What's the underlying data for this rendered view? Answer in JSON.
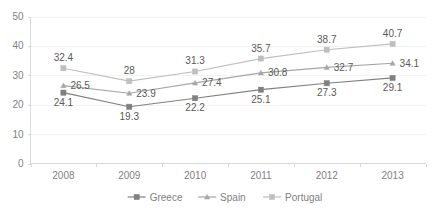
{
  "chart_data": {
    "type": "line",
    "title": "",
    "subtitle": "",
    "xlabel": "",
    "ylabel": "",
    "categories": [
      "2008",
      "2009",
      "2010",
      "2011",
      "2012",
      "2013"
    ],
    "ylim": [
      0,
      50
    ],
    "yticks": [
      0,
      10,
      20,
      30,
      40,
      50
    ],
    "ytick_labels": [
      "0",
      "10",
      "20",
      "30",
      "40",
      "50"
    ],
    "grid": true,
    "legend_position": "bottom",
    "series": [
      {
        "name": "Greece",
        "color": "#808080",
        "marker": "square",
        "values": [
          24.1,
          19.3,
          22.2,
          25.1,
          27.3,
          29.1
        ],
        "labels": [
          "24.1",
          "19.3",
          "22.2",
          "25.1",
          "27.3",
          "29.1"
        ],
        "label_positions": [
          "below",
          "below",
          "below",
          "below",
          "below",
          "below"
        ]
      },
      {
        "name": "Spain",
        "color": "#a6a6a6",
        "marker": "triangle",
        "values": [
          26.5,
          23.9,
          27.4,
          30.8,
          32.7,
          34.1
        ],
        "labels": [
          "26.5",
          "23.9",
          "27.4",
          "30.8",
          "32.7",
          "34.1"
        ],
        "label_positions": [
          "right",
          "right",
          "right",
          "right",
          "right",
          "right"
        ]
      },
      {
        "name": "Portugal",
        "color": "#bfbfbf",
        "marker": "square",
        "values": [
          32.4,
          28,
          31.3,
          35.7,
          38.7,
          40.7
        ],
        "labels": [
          "32.4",
          "28",
          "31.3",
          "35.7",
          "38.7",
          "40.7"
        ],
        "label_positions": [
          "above",
          "above",
          "above",
          "above",
          "above",
          "above"
        ]
      }
    ]
  },
  "legend": {
    "items": [
      {
        "label": "Greece"
      },
      {
        "label": "Spain"
      },
      {
        "label": "Portugal"
      }
    ]
  },
  "colors": {
    "greece": "#808080",
    "spain": "#a6a6a6",
    "portugal": "#bfbfbf",
    "gridline": "#f2f2f2",
    "axis": "#d9d9d9",
    "tick_text": "#7f7f7f",
    "label_text": "#595959",
    "background": "#ffffff"
  }
}
